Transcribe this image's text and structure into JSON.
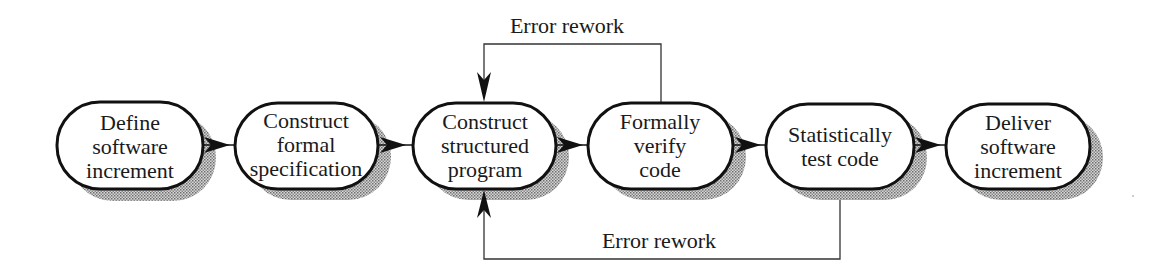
{
  "diagram": {
    "type": "process-flow",
    "colors": {
      "stroke": "#111111",
      "shadow": "#9a9a9a",
      "background": "#ffffff",
      "text": "#1a1a1a"
    },
    "nodes": [
      {
        "id": "n1",
        "lines": [
          "Define",
          "software",
          "increment"
        ],
        "x": 57,
        "y": 102,
        "w": 146,
        "h": 87
      },
      {
        "id": "n2",
        "lines": [
          "Construct",
          "formal",
          "specification"
        ],
        "x": 235,
        "y": 103,
        "w": 143,
        "h": 86
      },
      {
        "id": "n3",
        "lines": [
          "Construct",
          "structured",
          "program"
        ],
        "x": 413,
        "y": 103,
        "w": 143,
        "h": 86
      },
      {
        "id": "n4",
        "lines": [
          "Formally",
          "verify",
          "code"
        ],
        "x": 588,
        "y": 103,
        "w": 145,
        "h": 86
      },
      {
        "id": "n5",
        "lines": [
          "Statistically",
          "test code"
        ],
        "x": 766,
        "y": 104,
        "w": 148,
        "h": 85
      },
      {
        "id": "n6",
        "lines": [
          "Deliver",
          "software",
          "increment"
        ],
        "x": 946,
        "y": 104,
        "w": 144,
        "h": 85
      }
    ],
    "edges": [
      {
        "from": "n1",
        "to": "n2"
      },
      {
        "from": "n2",
        "to": "n3"
      },
      {
        "from": "n3",
        "to": "n4"
      },
      {
        "from": "n4",
        "to": "n5"
      },
      {
        "from": "n5",
        "to": "n6"
      }
    ],
    "feedback_loops": [
      {
        "label": "Error rework",
        "from": "n4",
        "to": "n3",
        "side": "top"
      },
      {
        "label": "Error rework",
        "from": "n5",
        "to": "n3",
        "side": "bottom"
      }
    ]
  }
}
